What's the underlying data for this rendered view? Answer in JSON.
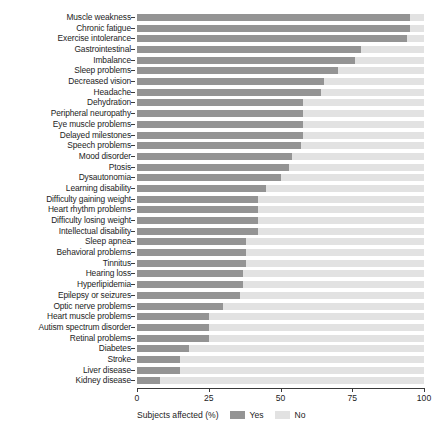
{
  "chart_data": {
    "type": "bar",
    "orientation": "horizontal",
    "stacked": true,
    "title": "",
    "xlabel": "Subjects affected (%)",
    "ylabel": "",
    "xlim": [
      0,
      100
    ],
    "xticks": [
      0,
      25,
      50,
      75,
      100
    ],
    "xtick_labels": [
      "0",
      "25",
      "50",
      "75",
      "100"
    ],
    "grid": false,
    "legend": {
      "title": "Subjects affected (%)",
      "position": "bottom",
      "entries": [
        {
          "label": "Yes",
          "color": "#949494"
        },
        {
          "label": "No",
          "color": "#e2e2e2"
        }
      ]
    },
    "categories": [
      "Muscle weakness",
      "Chronic fatigue",
      "Exercise intolerance",
      "Gastrointestinal",
      "Imbalance",
      "Sleep problems",
      "Decreased vision",
      "Headache",
      "Dehydration",
      "Peripheral neuropathy",
      "Eye muscle problems",
      "Delayed milestones",
      "Speech problems",
      "Mood disorder",
      "Ptosis",
      "Dysautonomia",
      "Learning disability",
      "Difficulty gaining weight",
      "Heart rhythm problems",
      "Difficulty losing weight",
      "Intellectual disability",
      "Sleep apnea",
      "Behavioral problems",
      "Tinnitus",
      "Hearing loss",
      "Hyperlipidemia",
      "Epilepsy or seizures",
      "Optic nerve problems",
      "Heart muscle problems",
      "Autism spectrum disorder",
      "Retinal problems",
      "Diabetes",
      "Stroke",
      "Liver disease",
      "Kidney disease"
    ],
    "series": [
      {
        "name": "Yes",
        "color": "#949494",
        "values": [
          95,
          95,
          94,
          78,
          76,
          70,
          65,
          64,
          58,
          58,
          58,
          58,
          57,
          54,
          53,
          50,
          45,
          42,
          42,
          42,
          42,
          38,
          38,
          38,
          37,
          37,
          36,
          30,
          25,
          25,
          25,
          18,
          15,
          15,
          8
        ]
      },
      {
        "name": "No",
        "color": "#e2e2e2",
        "values": [
          5,
          5,
          6,
          22,
          24,
          30,
          35,
          36,
          42,
          42,
          42,
          42,
          43,
          46,
          47,
          50,
          55,
          58,
          58,
          58,
          58,
          62,
          62,
          62,
          63,
          63,
          64,
          70,
          75,
          75,
          75,
          82,
          85,
          85,
          92
        ]
      }
    ]
  }
}
